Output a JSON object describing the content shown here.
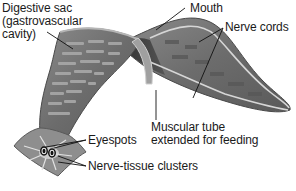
{
  "diagram": {
    "labels": [
      {
        "id": "digestive",
        "lines": [
          "Digestive sac",
          "(gastrovascular",
          "cavity)"
        ]
      },
      {
        "id": "mouth",
        "lines": [
          "Mouth"
        ]
      },
      {
        "id": "nerve_cords",
        "lines": [
          "Nerve cords"
        ]
      },
      {
        "id": "muscular_tube",
        "lines": [
          "Muscular tube",
          "extended for feeding"
        ]
      },
      {
        "id": "eyespots",
        "lines": [
          "Eyespots"
        ]
      },
      {
        "id": "nerve_tissue",
        "lines": [
          "Nerve-tissue clusters"
        ]
      }
    ]
  },
  "colors": {
    "body": "#6f6f6f",
    "body_dark": "#3d3d3d",
    "body_light": "#9a9a9a",
    "head": "#8c8c8c",
    "gut_pattern": "#a9a9a9",
    "nerve": "#d9d9d9",
    "leader_line": "#111111",
    "text": "#1a1a1a"
  }
}
